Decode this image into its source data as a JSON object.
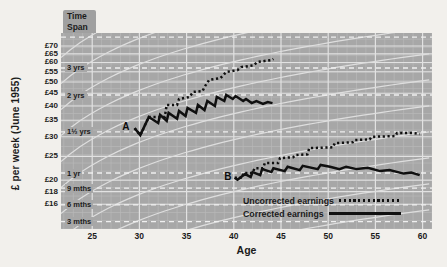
{
  "chart_data": {
    "type": "line",
    "xlabel": "Age",
    "ylabel": "£ per week (June 1955)",
    "x_domain": [
      21.7,
      61
    ],
    "y_domain": [
      12.7,
      79
    ],
    "y_scale": "log",
    "x_ticks": [
      25,
      30,
      35,
      40,
      45,
      50,
      55,
      60
    ],
    "y_ticks": [
      {
        "label": "£70",
        "value": 70
      },
      {
        "label": "£65",
        "value": 65
      },
      {
        "label": "£60",
        "value": 60
      },
      {
        "label": "£55",
        "value": 55
      },
      {
        "label": "£50",
        "value": 50
      },
      {
        "label": "£45",
        "value": 45
      },
      {
        "label": "£40",
        "value": 40
      },
      {
        "label": "£35",
        "value": 35
      },
      {
        "label": "£30",
        "value": 30
      },
      {
        "label": "£25",
        "value": 25
      },
      {
        "label": "£20",
        "value": 20
      },
      {
        "label": "£18",
        "value": 18
      },
      {
        "label": "£16",
        "value": 16
      }
    ],
    "time_span_header": {
      "line1": "Time",
      "line2": "Span"
    },
    "time_spans": [
      {
        "label": "3 yrs",
        "value": 57
      },
      {
        "label": "2 yrs",
        "value": 44.3
      },
      {
        "label": "1½ yrs",
        "value": 31.4
      },
      {
        "label": "1 yr",
        "value": 21.4
      },
      {
        "label": "9 mths",
        "value": 18.6
      },
      {
        "label": "6 mths",
        "value": 15.9
      },
      {
        "label": "3 mths",
        "value": 13.6
      }
    ],
    "top_dashed_value": 76,
    "guide_curves": "fan of white saturating growth guide-curves on grey log graph paper",
    "annotations": [
      {
        "label": "A",
        "age": 28.5,
        "value": 33
      },
      {
        "label": "B",
        "age": 39.3,
        "value": 20.6
      }
    ],
    "legend": [
      {
        "label": "Uncorrected earnings",
        "style": "dotted"
      },
      {
        "label": "Corrected earnings",
        "style": "solid"
      }
    ],
    "series": [
      {
        "name": "A uncorrected earnings",
        "style": "dotted",
        "points": [
          [
            29.5,
            32.5
          ],
          [
            30.1,
            30.5
          ],
          [
            31.0,
            36.1
          ],
          [
            32.7,
            36.1
          ],
          [
            32.9,
            40.4
          ],
          [
            34.0,
            40.4
          ],
          [
            34.2,
            42.7
          ],
          [
            35.3,
            43.5
          ],
          [
            35.7,
            45.6
          ],
          [
            36.7,
            46.0
          ],
          [
            36.9,
            47.8
          ],
          [
            37.4,
            51.0
          ],
          [
            38.6,
            51.9
          ],
          [
            39.2,
            54.9
          ],
          [
            40.4,
            55.9
          ],
          [
            40.8,
            57.5
          ],
          [
            42.1,
            58.4
          ],
          [
            42.5,
            60.3
          ],
          [
            44.0,
            61.4
          ],
          [
            44.2,
            62.0
          ]
        ]
      },
      {
        "name": "A corrected earnings",
        "style": "solid",
        "points": [
          [
            29.5,
            32.5
          ],
          [
            30.1,
            30.5
          ],
          [
            31.0,
            36.1
          ],
          [
            32.0,
            34.1
          ],
          [
            32.2,
            36.8
          ],
          [
            32.9,
            34.8
          ],
          [
            33.1,
            37.5
          ],
          [
            34.0,
            35.5
          ],
          [
            34.2,
            38.2
          ],
          [
            34.9,
            36.4
          ],
          [
            35.1,
            39.3
          ],
          [
            36.0,
            37.5
          ],
          [
            36.2,
            40.4
          ],
          [
            36.9,
            38.5
          ],
          [
            37.2,
            41.9
          ],
          [
            38.0,
            40.0
          ],
          [
            38.2,
            43.5
          ],
          [
            39.0,
            41.9
          ],
          [
            39.2,
            44.3
          ],
          [
            39.9,
            42.7
          ],
          [
            40.2,
            43.9
          ],
          [
            41.0,
            41.9
          ],
          [
            41.3,
            42.7
          ],
          [
            41.9,
            41.1
          ],
          [
            42.4,
            41.9
          ],
          [
            43.1,
            40.8
          ],
          [
            43.6,
            41.5
          ],
          [
            44.1,
            41.1
          ]
        ]
      },
      {
        "name": "B uncorrected earnings",
        "style": "dotted",
        "points": [
          [
            40.1,
            20.5
          ],
          [
            40.9,
            20.5
          ],
          [
            41.0,
            21.4
          ],
          [
            42.0,
            21.4
          ],
          [
            42.2,
            22.4
          ],
          [
            43.1,
            22.4
          ],
          [
            43.3,
            23.5
          ],
          [
            44.7,
            23.5
          ],
          [
            44.9,
            24.6
          ],
          [
            46.3,
            24.8
          ],
          [
            46.5,
            25.3
          ],
          [
            47.8,
            25.5
          ],
          [
            48.0,
            27.0
          ],
          [
            50.5,
            27.2
          ],
          [
            50.7,
            28.3
          ],
          [
            52.6,
            28.5
          ],
          [
            52.8,
            29.1
          ],
          [
            54.4,
            29.3
          ],
          [
            54.6,
            30.0
          ],
          [
            57.1,
            30.2
          ],
          [
            57.3,
            31.1
          ],
          [
            59.0,
            31.1
          ],
          [
            59.7,
            30.8
          ]
        ]
      },
      {
        "name": "B corrected earnings",
        "style": "solid",
        "points": [
          [
            40.1,
            20.5
          ],
          [
            40.4,
            20.1
          ],
          [
            41.2,
            21.2
          ],
          [
            41.8,
            20.6
          ],
          [
            42.0,
            21.6
          ],
          [
            42.8,
            21.0
          ],
          [
            43.0,
            22.2
          ],
          [
            44.0,
            21.6
          ],
          [
            44.2,
            22.4
          ],
          [
            45.4,
            21.8
          ],
          [
            45.7,
            22.7
          ],
          [
            47.0,
            22.0
          ],
          [
            47.3,
            22.9
          ],
          [
            48.9,
            22.2
          ],
          [
            49.2,
            23.1
          ],
          [
            50.2,
            22.7
          ],
          [
            51.2,
            22.2
          ],
          [
            51.9,
            22.7
          ],
          [
            53.0,
            22.2
          ],
          [
            54.2,
            22.5
          ],
          [
            55.5,
            21.8
          ],
          [
            56.5,
            22.0
          ],
          [
            58.0,
            21.3
          ],
          [
            58.8,
            21.5
          ],
          [
            59.7,
            21.0
          ]
        ]
      }
    ],
    "colors": {
      "series": "#101010",
      "plot_bg": "#a7a7a7",
      "grid_minor": "#b9b9b9",
      "grid_major": "#e2e2e2",
      "dashed": "#efefef",
      "guide_curve": "#dedede",
      "text": "#1b1b1b"
    }
  }
}
